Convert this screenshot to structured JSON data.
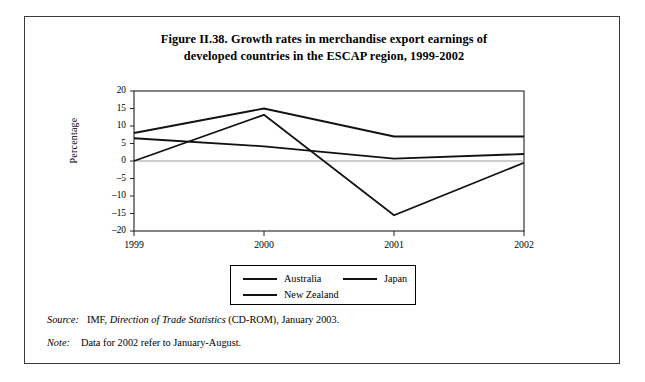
{
  "figure": {
    "title_line1": "Figure II.38.  Growth rates in merchandise export earnings of",
    "title_line2": "developed countries in the ESCAP region, 1999-2002"
  },
  "axis": {
    "y_title": "Percentage"
  },
  "legend": {
    "items": [
      {
        "label": "Australia",
        "color": "#111111"
      },
      {
        "label": "Japan",
        "color": "#111111"
      },
      {
        "label": "New Zealand",
        "color": "#111111"
      }
    ]
  },
  "footnotes": {
    "source_key": "Source:",
    "source_pre": "IMF,",
    "source_italic": "Direction of Trade Statistics",
    "source_post": "(CD-ROM), January 2003.",
    "note_key": "Note:",
    "note_text": "Data for 2002 refer to January-August."
  },
  "chart_data": {
    "type": "line",
    "title": "Figure II.38.  Growth rates in merchandise export earnings of developed countries in the ESCAP region, 1999-2002",
    "xlabel": "",
    "ylabel": "Percentage",
    "x": [
      "1999",
      "2000",
      "2001",
      "2002"
    ],
    "ylim": [
      -20,
      20
    ],
    "yticks": [
      20,
      15,
      10,
      5,
      0,
      -5,
      -10,
      -15,
      -20
    ],
    "ytick_labels": [
      "20",
      "15",
      "10",
      "5",
      "0",
      "–5",
      "–10",
      "–15",
      "–20"
    ],
    "grid": false,
    "zero_line": true,
    "legend_position": "bottom",
    "series": [
      {
        "name": "Australia",
        "values": [
          8.0,
          15.0,
          7.0,
          7.0
        ],
        "color": "#111111"
      },
      {
        "name": "Japan",
        "values": [
          6.5,
          4.2,
          0.7,
          2.0
        ],
        "color": "#111111"
      },
      {
        "name": "New Zealand",
        "values": [
          0.0,
          13.2,
          -15.5,
          -0.5
        ],
        "color": "#111111"
      }
    ]
  }
}
